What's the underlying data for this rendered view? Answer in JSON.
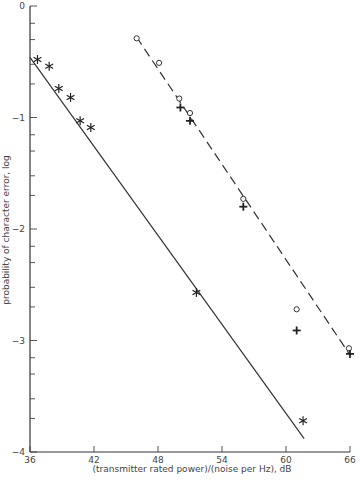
{
  "chart_data": {
    "type": "scatter",
    "title": "",
    "xlabel": "(transmitter rated power)/(noise per Hz), dB",
    "ylabel": "probability of character error, log",
    "xlim": [
      36,
      66
    ],
    "ylim": [
      -4,
      0
    ],
    "x_ticks": [
      36,
      42,
      48,
      54,
      60,
      66
    ],
    "x_tick_labels": [
      "36",
      "42",
      "48",
      "54",
      "60",
      "66"
    ],
    "y_ticks": [
      0,
      -1,
      -2,
      -3,
      -4
    ],
    "y_tick_labels": [
      "0",
      "−1",
      "−2",
      "−3",
      "−4"
    ],
    "y_minor_ticks": "log-scale subdivisions per decade",
    "grid": false,
    "series": [
      {
        "name": "asterisk points",
        "marker": "asterisk",
        "x": [
          36.7,
          37.8,
          38.7,
          39.8,
          40.7,
          41.7,
          51.6,
          61.6
        ],
        "y": [
          -0.48,
          -0.54,
          -0.74,
          -0.82,
          -1.03,
          -1.09,
          -2.57,
          -3.72
        ]
      },
      {
        "name": "circle points",
        "marker": "circle",
        "x": [
          46.0,
          48.1,
          50.0,
          51.0,
          56.0,
          61.0,
          65.9
        ],
        "y": [
          -0.29,
          -0.51,
          -0.83,
          -0.96,
          -1.73,
          -2.72,
          -3.07
        ]
      },
      {
        "name": "plus points",
        "marker": "plus",
        "x": [
          50.1,
          51.0,
          56.0,
          61.0,
          66.0
        ],
        "y": [
          -0.91,
          -1.03,
          -1.8,
          -2.91,
          -3.12
        ]
      }
    ],
    "lines": [
      {
        "name": "solid fit line",
        "style": "solid",
        "x": [
          36.0,
          61.7
        ],
        "y": [
          -0.46,
          -3.88
        ]
      },
      {
        "name": "dashed fit line",
        "style": "dashed",
        "x": [
          46.0,
          66.0
        ],
        "y": [
          -0.28,
          -3.13
        ]
      }
    ]
  }
}
